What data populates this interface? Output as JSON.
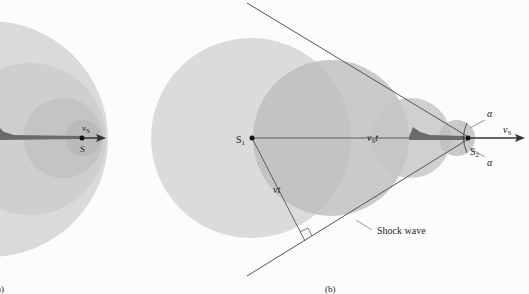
{
  "panel_a": {
    "label": "(a)",
    "source_label": "S",
    "velocity_label": "v",
    "velocity_sub": "S"
  },
  "panel_b": {
    "label": "(b)",
    "s1_label": "S",
    "s1_sub": "1",
    "s2_label": "S",
    "s2_sub": "2",
    "velocity_label": "v",
    "velocity_sub": "S",
    "vst_label": "v",
    "vst_sub": "S",
    "vst_suffix": "t",
    "vt_label": "vt",
    "alpha_top": "α",
    "alpha_bottom": "α",
    "shock_wave_label": "Shock wave"
  },
  "colors": {
    "background": "#fcfcfc",
    "wavefront_light": "#d9d9d9",
    "wavefront_mid": "#c4c4c4",
    "wavefront_dark": "#b0b0b0",
    "line": "#555555",
    "aircraft": "#6a6a6a"
  }
}
